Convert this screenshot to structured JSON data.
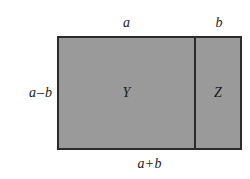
{
  "diagram": {
    "background_color": "#ffffff",
    "fill_color": "#9a9a9a",
    "stroke_color": "#2b2b2b",
    "regions": [
      {
        "key": "y",
        "label": "Y"
      },
      {
        "key": "z",
        "label": "Z"
      }
    ],
    "dimensions": {
      "top_left": "a",
      "top_right": "b",
      "left": {
        "first": "a",
        "operator": "–",
        "second": "b"
      },
      "bottom": {
        "first": "a",
        "operator": "+",
        "second": "b"
      }
    }
  }
}
